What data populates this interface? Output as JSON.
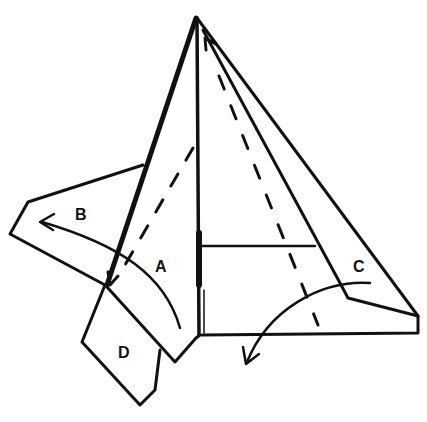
{
  "diagram": {
    "type": "origami-folding-step",
    "labels": {
      "A": "A",
      "B": "B",
      "C": "C",
      "D": "D"
    },
    "colors": {
      "ink": "#111111",
      "paper": "#ffffff"
    }
  }
}
